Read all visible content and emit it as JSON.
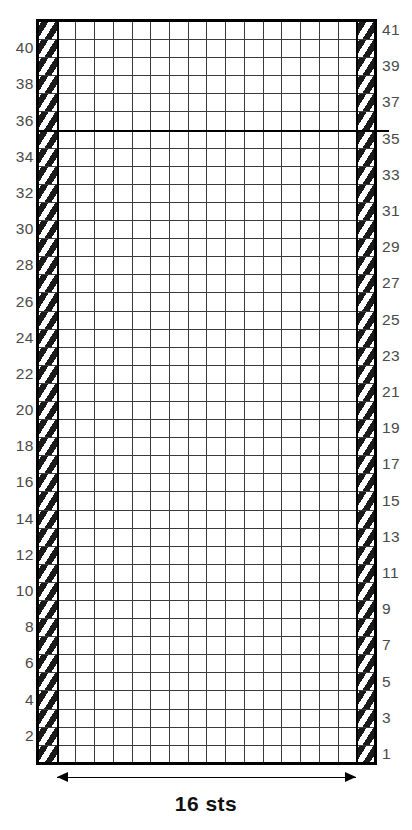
{
  "chart_data": {
    "type": "heatmap",
    "title": "",
    "caption": "16 sts",
    "columns": 18,
    "rows": 41,
    "xlabel": "",
    "ylabel": "",
    "legend": [
      {
        "key": "dark",
        "label": "contrast colour stitch",
        "color": "#6e6e6e"
      },
      {
        "key": "light",
        "label": "background colour stitch",
        "color": "#ffffff"
      },
      {
        "key": "edge",
        "label": "edge / selvedge stitch",
        "color": "#1a1a1a"
      }
    ],
    "repeat_columns": [
      2,
      17
    ],
    "repeat_row_divider_after": 35,
    "row_labels_left": [
      40,
      38,
      36,
      34,
      32,
      30,
      28,
      26,
      24,
      22,
      20,
      18,
      16,
      14,
      12,
      10,
      8,
      6,
      4,
      2
    ],
    "row_labels_right": [
      41,
      39,
      37,
      35,
      33,
      31,
      29,
      27,
      25,
      23,
      21,
      19,
      17,
      15,
      13,
      11,
      9,
      7,
      5,
      3,
      1
    ],
    "grid_top_to_bottom": [
      {
        "row": 41,
        "cells": "eddldddldddldddldde"
      },
      {
        "row": 40,
        "cells": "eddddddddddddddddde"
      },
      {
        "row": 39,
        "cells": "eddddddddddddddddde"
      },
      {
        "row": 38,
        "cells": "edlddldddldddlddlde"
      },
      {
        "row": 37,
        "cells": "eddddddddddddddddde"
      },
      {
        "row": 36,
        "cells": "eddddddddddddddddde"
      },
      {
        "row": 35,
        "cells": "ellllllllllllllllle"
      },
      {
        "row": 34,
        "cells": "ellllllllllllllllle"
      },
      {
        "row": 33,
        "cells": "edlddldddldddlddlde"
      },
      {
        "row": 32,
        "cells": "eddlddldddlddlddlde"
      },
      {
        "row": 31,
        "cells": "edddlddldddlddlddde"
      },
      {
        "row": 30,
        "cells": "eldddlddldddlddldle"
      },
      {
        "row": 29,
        "cells": "ellllllllllllllllle"
      },
      {
        "row": 28,
        "cells": "ellllllllllllllllle"
      },
      {
        "row": 27,
        "cells": "eddddddddddddddddde"
      },
      {
        "row": 26,
        "cells": "eddddddddddddddddde"
      },
      {
        "row": 25,
        "cells": "edlddldddddlddlddde"
      },
      {
        "row": 24,
        "cells": "elddllddddllddddlle"
      },
      {
        "row": 23,
        "cells": "eddddlddddlddddddde"
      },
      {
        "row": 22,
        "cells": "edlddlddddlddlddlde"
      },
      {
        "row": 21,
        "cells": "elddllddddllddlddle"
      },
      {
        "row": 20,
        "cells": "edldlllddlllllddlde"
      },
      {
        "row": 19,
        "cells": "eldldllllllldllldle"
      },
      {
        "row": 18,
        "cells": "edldllldlllddllddle"
      },
      {
        "row": 17,
        "cells": "eldldlllllldlldldde"
      },
      {
        "row": 16,
        "cells": "elddllldllldlddlddle"
      },
      {
        "row": 15,
        "cells": "eldldllllllldllldle"
      },
      {
        "row": 14,
        "cells": "edldlllddlllllddlde"
      },
      {
        "row": 13,
        "cells": "elddllddddllddlddle"
      },
      {
        "row": 12,
        "cells": "edlddlddddlddlddlde"
      },
      {
        "row": 11,
        "cells": "eddddlddddlddddddde"
      },
      {
        "row": 10,
        "cells": "elddllddddllddddlle"
      },
      {
        "row": 9,
        "cells": "edlddldddddlddlddde"
      },
      {
        "row": 8,
        "cells": "eddddddddddddddddde"
      },
      {
        "row": 7,
        "cells": "eddddddddddddddddde"
      },
      {
        "row": 6,
        "cells": "ellllllllllllllllle"
      },
      {
        "row": 5,
        "cells": "ellllllllllllllllle"
      },
      {
        "row": 4,
        "cells": "eldddlddldddlddldle"
      },
      {
        "row": 3,
        "cells": "edddlddldddlddlddde"
      },
      {
        "row": 2,
        "cells": "eddlddldddlddlddlde"
      },
      {
        "row": 1,
        "cells": "edlddldddldddlddlde"
      }
    ]
  },
  "chart": {
    "caption": "16 sts",
    "row_numbers_left": [
      "40",
      "38",
      "36",
      "34",
      "32",
      "30",
      "28",
      "26",
      "24",
      "22",
      "20",
      "18",
      "16",
      "14",
      "12",
      "10",
      "8",
      "6",
      "4",
      "2"
    ],
    "row_numbers_right": [
      "41",
      "39",
      "37",
      "35",
      "33",
      "31",
      "29",
      "27",
      "25",
      "23",
      "21",
      "19",
      "17",
      "15",
      "13",
      "11",
      "9",
      "7",
      "5",
      "3",
      "1"
    ],
    "colors": {
      "dark_stitch": "#6e6e6e",
      "light_stitch": "#ffffff",
      "edge_stitch": "#1a1a1a",
      "gridline": "#3b3b3b",
      "frame": "#000000",
      "label_text": "#4a4a4a",
      "caption_text": "#111111"
    }
  }
}
